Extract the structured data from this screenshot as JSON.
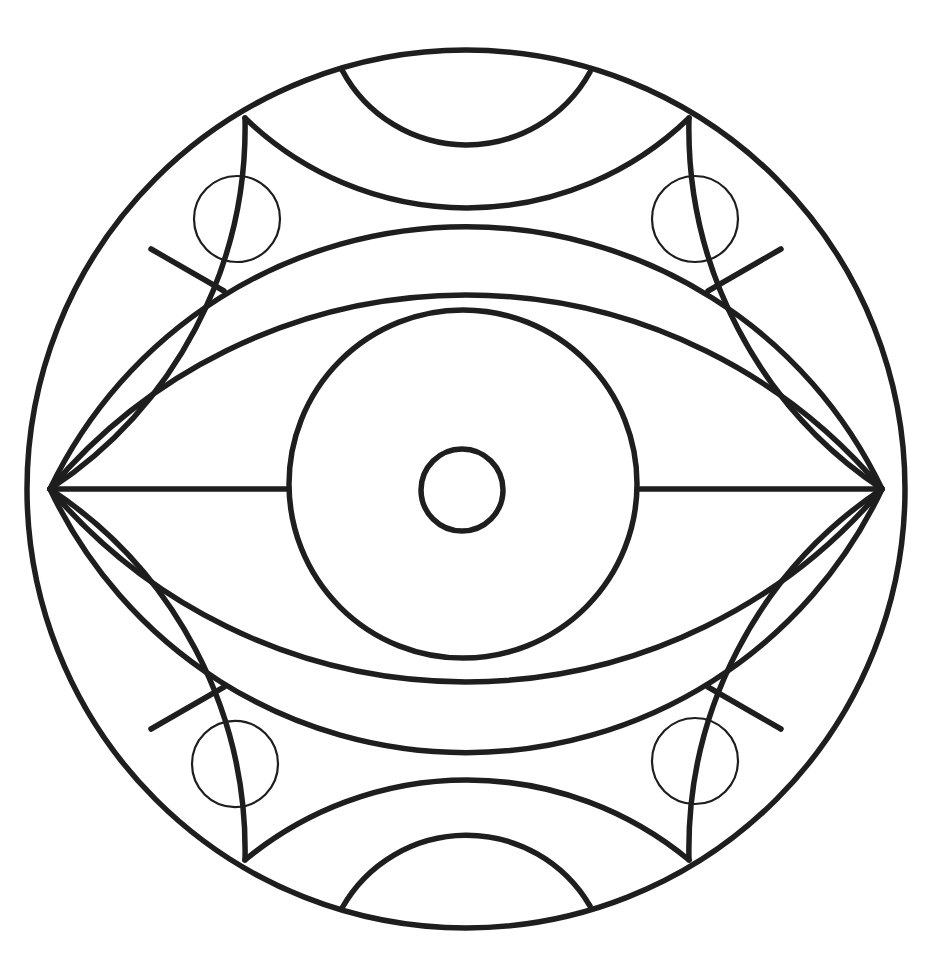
{
  "artwork": {
    "title": "Eye mandala line drawing (coloring page)",
    "type": "black-and-white line art",
    "background_color": "#ffffff",
    "ink_color": "#1e1e1e",
    "stroke_main": "5.5",
    "stroke_thin": "2.2",
    "canvas_width": "935",
    "canvas_height": "965"
  },
  "paths": {
    "outer_circle": "M 27,489 A 439,439 0 1 0 905,489 A 439,439 0 1 0 27,489 Z",
    "rim_inner_arc_upper_left": "M 50,489 A 433,433 0 0 0 245,118",
    "rim_inner_arc_upper_right": "M 882,489 A 433,433 0 0 1 689,118",
    "rim_inner_arc_lower_left": "M 50,489 A 433,433 0 0 1 245,860",
    "rim_inner_arc_lower_right": "M 882,489 A 433,433 0 0 0 689,860",
    "top_band_lower_curve": "M 245,118 A 319,319 0 0 0 689,118",
    "bottom_band_upper_curve": "M 245,860 A 348,348 0 0 1 689,860",
    "top_arch_arc": "M 342,70 A 141,141 0 0 0 590,72",
    "bottom_arch_arc": "M 342,908 A 143,143 0 0 1 590,906",
    "upper_eyelid_outer_arc": "M 50,489 A 461,461 0 0 1 882,489",
    "upper_eyelid_inner_arc": "M 50,489 A 543,543 0 0 1 882,489",
    "lower_eyelid_inner_arc": "M 50,489 A 545,545 0 0 0 882,489",
    "lower_eyelid_outer_arc": "M 50,489 A 460,460 0 0 0 882,489",
    "eye_axis_line_left": "M 50,489 L 288,489",
    "eye_axis_line_right": "M 639,489 L 882,489",
    "iris_circle": "M 289,484 A 174,174 0 1 0 637,484 A 174,174 0 1 0 289,484 Z",
    "pupil_circle": "M 421,490 A 41,41 0 1 0 503,490 A 41,41 0 1 0 421,490 Z",
    "divider_line_upper_left": "M 151,249 L 224,291",
    "divider_line_upper_right": "M 781,249 L 708,291",
    "divider_line_lower_left": "M 151,729 L 224,687",
    "divider_line_lower_right": "M 781,729 L 708,687",
    "ornament_circle_upper_left": "M 194,219 A 43,43 0 1 0 280,219 A 43,43 0 1 0 194,219 Z",
    "ornament_circle_upper_right": "M 652,219 A 43,43 0 1 0 738,219 A 43,43 0 1 0 652,219 Z",
    "ornament_circle_lower_left": "M 192,764 A 43,43 0 1 0 278,764 A 43,43 0 1 0 192,764 Z",
    "ornament_circle_lower_right": "M 652,761 A 43,43 0 1 0 738,761 A 43,43 0 1 0 652,761 Z"
  }
}
